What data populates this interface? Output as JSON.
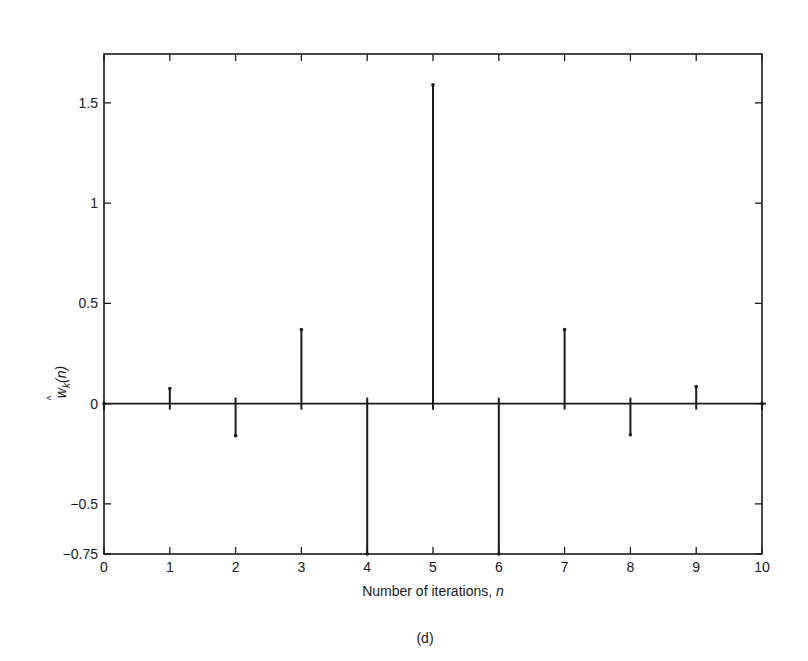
{
  "chart_data": {
    "type": "stem",
    "title": "",
    "caption": "(d)",
    "xlabel": "Number of iterations, n",
    "xlabel_main": "Number of iterations, ",
    "xlabel_var": "n",
    "ylabel": "ŵk(n)",
    "ylabel_base": "w",
    "ylabel_sub": "k",
    "ylabel_arg": "(n)",
    "xlim": [
      0,
      10
    ],
    "ylim": [
      -0.75,
      1.75
    ],
    "xticks": [
      0,
      1,
      2,
      3,
      4,
      5,
      6,
      7,
      8,
      9,
      10
    ],
    "xtick_labels": [
      "0",
      "1",
      "2",
      "3",
      "4",
      "5",
      "6",
      "7",
      "8",
      "9",
      "10"
    ],
    "yticks": [
      -0.75,
      -0.5,
      0,
      0.5,
      1,
      1.5
    ],
    "ytick_labels": [
      "−0.75",
      "−0.5",
      "0",
      "0.5",
      "1",
      "1.5"
    ],
    "grid": false,
    "legend": null,
    "x": [
      0,
      1,
      2,
      3,
      4,
      5,
      6,
      7,
      8,
      9,
      10
    ],
    "values": [
      0,
      0.075,
      -0.16,
      0.37,
      -0.75,
      1.59,
      -0.75,
      0.37,
      -0.155,
      0.085,
      0
    ],
    "line_color": "#1a1a1a",
    "background": "#ffffff"
  }
}
